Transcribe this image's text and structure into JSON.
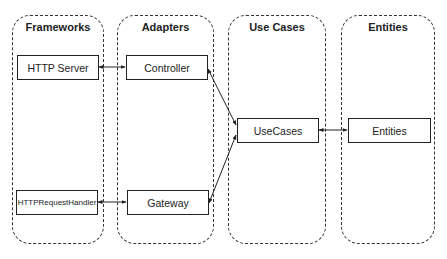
{
  "layers": [
    {
      "id": "frameworks",
      "title": "Frameworks"
    },
    {
      "id": "adapters",
      "title": "Adapters"
    },
    {
      "id": "usecases",
      "title": "Use Cases"
    },
    {
      "id": "entities",
      "title": "Entities"
    }
  ],
  "nodes": {
    "http_server": "HTTP Server",
    "http_request_handler": "HTTPRequestHandler",
    "controller": "Controller",
    "gateway": "Gateway",
    "usecases": "UseCases",
    "entities": "Entities"
  },
  "edges": [
    {
      "from": "HTTP Server",
      "to": "Controller",
      "style": "bidirectional"
    },
    {
      "from": "HTTPRequestHandler",
      "to": "Gateway",
      "style": "bidirectional"
    },
    {
      "from": "UseCases",
      "to": "Controller",
      "style": "arrow"
    },
    {
      "from": "UseCases",
      "to": "Gateway",
      "style": "arrow"
    },
    {
      "from": "UseCases",
      "to": "Entities",
      "style": "bidirectional"
    }
  ],
  "colors": {
    "stroke": "#222222",
    "background": "#ffffff"
  }
}
